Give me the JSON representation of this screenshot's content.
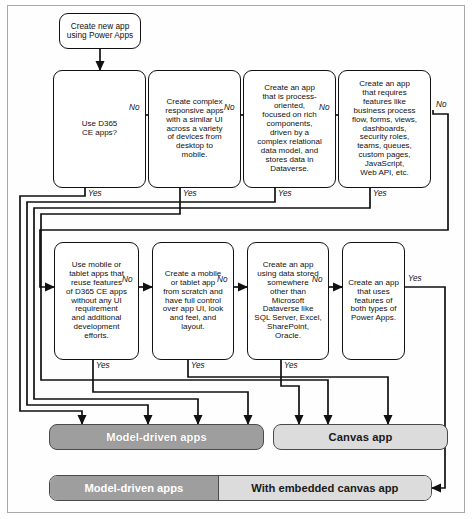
{
  "diagram": {
    "start": {
      "label": "Create new app\nusing Power Apps"
    },
    "row1": [
      {
        "id": "d1",
        "label": "Use D365\nCE apps?"
      },
      {
        "id": "d2",
        "label": "Create complex\nresponsive apps\nwith a similar UI\nacross a variety\nof devices from\ndesktop to\nmobile."
      },
      {
        "id": "d3",
        "label": "Create an app\nthat is process-\noriented,\nfocused on rich\ncomponents,\ndriven by a\ncomplex relational\ndata model, and\nstores data in\nDataverse."
      },
      {
        "id": "d4",
        "label": "Create an app\nthat requires\nfeatures like\nbusiness process\nflow, forms, views,\ndashboards,\nsecurity roles,\nteams, queues,\ncustom pages,\nJavaScript,\nWeb API, etc."
      }
    ],
    "row2": [
      {
        "id": "d5",
        "label": "Use mobile or\ntablet apps that\nreuse features\nof D365 CE apps\nwithout any UI\nrequirement\nand additional\ndevelopment\nefforts."
      },
      {
        "id": "d6",
        "label": "Create a mobile\nor tablet app\nfrom scratch and\nhave full control\nover app UI, look\nand feel, and\nlayout."
      },
      {
        "id": "d7",
        "label": "Create an app\nusing data stored\nsomewhere\nother than\nMicrosoft\nDataverse like\nSQL Server, Excel,\nSharePoint,\nOracle."
      },
      {
        "id": "d8",
        "label": "Create an app\nthat uses\nfeatures of\nboth types of\nPower Apps."
      }
    ],
    "results": {
      "model_driven": "Model-driven apps",
      "canvas": "Canvas app",
      "bottom_left": "Model-driven apps",
      "bottom_right": "With embedded canvas app"
    },
    "edge_labels": {
      "no": "No",
      "yes": "Yes"
    },
    "edges": [
      {
        "from": "d1",
        "to": "d2",
        "label": "No"
      },
      {
        "from": "d2",
        "to": "d3",
        "label": "No"
      },
      {
        "from": "d3",
        "to": "d4",
        "label": "No"
      },
      {
        "from": "d4",
        "to": "d5",
        "label": "No"
      },
      {
        "from": "d5",
        "to": "d6",
        "label": "No"
      },
      {
        "from": "d6",
        "to": "d7",
        "label": "No"
      },
      {
        "from": "d7",
        "to": "d8",
        "label": "No"
      },
      {
        "from": "d1",
        "to": "model_driven",
        "label": "Yes"
      },
      {
        "from": "d2",
        "to": "canvas",
        "label": "Yes"
      },
      {
        "from": "d3",
        "to": "model_driven",
        "label": "Yes"
      },
      {
        "from": "d4",
        "to": "model_driven",
        "label": "Yes"
      },
      {
        "from": "d5",
        "to": "model_driven",
        "label": "Yes"
      },
      {
        "from": "d6",
        "to": "canvas",
        "label": "Yes"
      },
      {
        "from": "d7",
        "to": "model_driven",
        "label": "Yes"
      },
      {
        "from": "d8",
        "to": "bottom_bar",
        "label": "Yes"
      }
    ],
    "colors": {
      "dark_fill": "#9e9e9e",
      "light_fill": "#dcdcdc",
      "stroke": "#111111",
      "frame": "#a9a9a9"
    }
  }
}
